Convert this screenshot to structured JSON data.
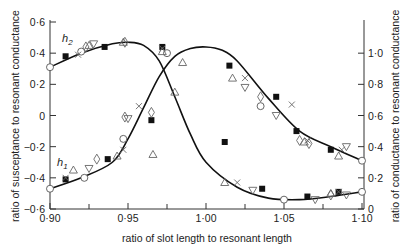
{
  "chart_data": {
    "type": "line",
    "title": "",
    "xlabel": "ratio of slot length to resonant length",
    "ylabel_left": "ratio of susceptance to resonant conductance",
    "ylabel_right": "ratio of conductance to resonant conductance",
    "xlim": [
      0.9,
      1.1
    ],
    "ylim_left": [
      -0.6,
      0.6
    ],
    "ylim_right": [
      0,
      1.2
    ],
    "x_ticks": [
      "0·90",
      "0·95",
      "1·00",
      "1·05",
      "1·10"
    ],
    "y_left_ticks": [
      "0·6",
      "0·4",
      "0·2",
      "0",
      "−0·2",
      "−0·4",
      "−0·6"
    ],
    "y_right_ticks": [
      "1·0",
      "0·8",
      "0·6",
      "0·4",
      "0·2",
      "0"
    ],
    "grid": false,
    "legend": "none",
    "annotations": [
      "h2",
      "h1"
    ],
    "series": [
      {
        "name": "susceptance curve (falls through zero near 0·985)",
        "axis": "left",
        "x": [
          0.9,
          0.92,
          0.94,
          0.95,
          0.96,
          0.97,
          0.98,
          0.99,
          1.0,
          1.02,
          1.04,
          1.06,
          1.08,
          1.1
        ],
        "y": [
          0.31,
          0.4,
          0.46,
          0.47,
          0.45,
          0.35,
          0.12,
          -0.12,
          -0.3,
          -0.46,
          -0.53,
          -0.54,
          -0.52,
          -0.49
        ]
      },
      {
        "name": "conductance curve (peak near 1·00)",
        "axis": "right",
        "x": [
          0.9,
          0.92,
          0.94,
          0.95,
          0.96,
          0.97,
          0.98,
          0.99,
          1.0,
          1.01,
          1.02,
          1.04,
          1.06,
          1.08,
          1.1
        ],
        "y": [
          0.13,
          0.2,
          0.3,
          0.45,
          0.65,
          0.85,
          0.98,
          1.03,
          1.04,
          1.02,
          0.95,
          0.71,
          0.5,
          0.4,
          0.31
        ]
      }
    ],
    "markers": [
      {
        "shape": "square",
        "x": 0.91,
        "y_left": 0.38
      },
      {
        "shape": "square",
        "x": 0.935,
        "y_left": 0.44
      },
      {
        "shape": "square",
        "x": 0.972,
        "y_left": 0.44
      },
      {
        "shape": "square",
        "x": 0.965,
        "y_left": -0.03
      },
      {
        "shape": "square",
        "x": 0.91,
        "y_left": -0.41
      },
      {
        "shape": "square",
        "x": 0.937,
        "y_left": -0.28
      },
      {
        "shape": "square",
        "x": 1.012,
        "y_left": -0.17
      },
      {
        "shape": "square",
        "x": 1.036,
        "y_left": -0.47
      },
      {
        "shape": "square",
        "x": 1.065,
        "y_left": -0.52
      },
      {
        "shape": "square",
        "x": 1.085,
        "y_left": -0.49
      },
      {
        "shape": "square",
        "x": 1.015,
        "y_right": 0.92
      },
      {
        "shape": "square",
        "x": 1.045,
        "y_right": 0.72
      },
      {
        "shape": "square",
        "x": 1.058,
        "y_right": 0.5
      },
      {
        "shape": "square",
        "x": 1.08,
        "y_right": 0.38
      },
      {
        "shape": "circle",
        "x": 0.9,
        "y_left": 0.31
      },
      {
        "shape": "circle",
        "x": 0.92,
        "y_left": 0.41
      },
      {
        "shape": "circle",
        "x": 0.975,
        "y_left": 0.4
      },
      {
        "shape": "circle",
        "x": 0.9,
        "y_left": -0.47
      },
      {
        "shape": "circle",
        "x": 0.922,
        "y_left": -0.4
      },
      {
        "shape": "circle",
        "x": 0.947,
        "y_left": -0.15
      },
      {
        "shape": "circle",
        "x": 1.05,
        "y_left": -0.54
      },
      {
        "shape": "circle",
        "x": 1.1,
        "y_left": -0.49
      },
      {
        "shape": "circle",
        "x": 1.1,
        "y_right": 0.31
      },
      {
        "shape": "circle",
        "x": 1.035,
        "y_right": 0.66
      }
    ]
  }
}
